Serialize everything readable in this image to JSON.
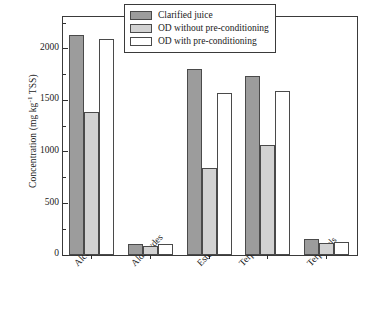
{
  "chart_data": {
    "type": "bar",
    "title": "",
    "xlabel": "",
    "ylabel": "Concentration (mg kg⁻¹ TSS)",
    "ylabel_parts": {
      "main": "Concentration (mg kg",
      "sup": "-1",
      "tail": " TSS)"
    },
    "categories": [
      "Alcohols",
      "Aldehydes",
      "Esters",
      "Terp. hydroc.",
      "Terpenols"
    ],
    "series": [
      {
        "name": "Clarified juice",
        "color": "#9c9c9c",
        "values": [
          2140,
          110,
          1810,
          1735,
          155
        ]
      },
      {
        "name": "OD without pre-conditioning",
        "color": "#d2d2d2",
        "values": [
          1385,
          90,
          840,
          1065,
          115
        ]
      },
      {
        "name": "OD with pre-conditioning",
        "color": "#ffffff",
        "values": [
          2100,
          105,
          1570,
          1595,
          130
        ]
      }
    ],
    "ylim": [
      0,
      2310
    ],
    "yticks": [
      0,
      500,
      1000,
      1500,
      2000
    ],
    "ytick_labels": [
      "0",
      "500",
      "1000",
      "1500",
      "2000"
    ],
    "yminor_ticks": [
      250,
      750,
      1250,
      1750,
      2250
    ],
    "grid": false,
    "legend_position": "top-right",
    "axis_color": "#3a3a3a"
  }
}
